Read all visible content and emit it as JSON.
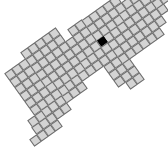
{
  "board": {
    "origin": [
      102,
      42
    ],
    "unit": 8.5,
    "angle_deg": 35,
    "colors": {
      "cell": "#d4d4d4",
      "border": "#6e6e6e",
      "selected": "#000000"
    },
    "selected_cell": [
      0,
      0
    ],
    "rows": [
      {
        "a": 9,
        "b": [
          -1,
          0
        ]
      },
      {
        "a": 8,
        "b": [
          -1,
          1
        ]
      },
      {
        "a": 7,
        "b": [
          -2,
          2
        ]
      },
      {
        "a": 6,
        "b": [
          -2,
          3
        ]
      },
      {
        "a": 5,
        "b": [
          -2,
          3
        ]
      },
      {
        "a": 4,
        "b": [
          -3,
          3
        ]
      },
      {
        "a": 3,
        "b": [
          -3,
          3
        ]
      },
      {
        "a": 2,
        "b": [
          -3,
          3
        ]
      },
      {
        "a": 1,
        "b": [
          -3,
          6
        ]
      },
      {
        "a": 0,
        "b": [
          -3,
          6
        ]
      },
      {
        "a": -1,
        "b": [
          -3,
          5
        ]
      },
      {
        "a": -2,
        "b": [
          -3,
          2
        ]
      },
      {
        "a": -3,
        "b": [
          -2,
          2
        ]
      },
      {
        "a": -4,
        "b": [
          -4,
          2
        ]
      },
      {
        "a": -5,
        "b": [
          -4,
          3
        ]
      },
      {
        "a": -6,
        "b": [
          -4,
          3
        ]
      },
      {
        "a": -7,
        "b": [
          -4,
          3
        ]
      },
      {
        "a": -8,
        "b": [
          -4,
          4
        ]
      },
      {
        "a": -9,
        "b": [
          -3,
          4
        ]
      },
      {
        "a": -10,
        "b": [
          -3,
          5
        ]
      },
      {
        "a": -11,
        "b": [
          -3,
          5
        ]
      },
      {
        "a": -12,
        "b": [
          3,
          5
        ]
      },
      {
        "a": -13,
        "b": [
          5,
          5
        ]
      }
    ]
  }
}
